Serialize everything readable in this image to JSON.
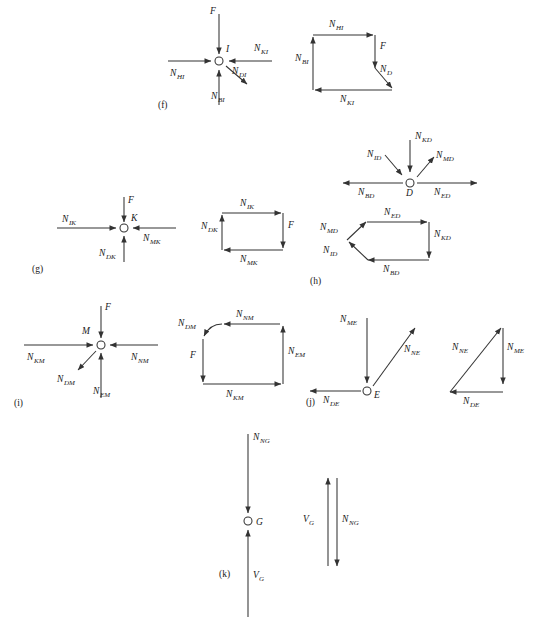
{
  "figure": {
    "kind": "force-polygon-diagram",
    "background_color": "#ffffff",
    "line_color": "#333333",
    "text_color": "#1a1a1a"
  },
  "panels": [
    {
      "id": "f",
      "label": "(f)",
      "joint": {
        "node_label": "I",
        "forces": [
          {
            "name": "F",
            "base": "F",
            "sub": "",
            "direction": "down"
          },
          {
            "name": "N_HI",
            "base": "N",
            "sub": "HI",
            "direction": "right"
          },
          {
            "name": "N_KI",
            "base": "N",
            "sub": "KI",
            "direction": "left"
          },
          {
            "name": "N_BI",
            "base": "N",
            "sub": "BI",
            "direction": "up"
          },
          {
            "name": "N_DI",
            "base": "N",
            "sub": "DI",
            "direction": "down-right"
          }
        ]
      },
      "polygon": {
        "edges": [
          {
            "name": "N_HI",
            "base": "N",
            "sub": "HI",
            "direction": "right"
          },
          {
            "name": "F",
            "base": "F",
            "sub": "",
            "direction": "down"
          },
          {
            "name": "N_D",
            "base": "N",
            "sub": "D",
            "direction": "down-right"
          },
          {
            "name": "N_KI",
            "base": "N",
            "sub": "KI",
            "direction": "left"
          },
          {
            "name": "N_BI",
            "base": "N",
            "sub": "BI",
            "direction": "up"
          }
        ]
      }
    },
    {
      "id": "g",
      "label": "(g)",
      "joint": {
        "node_label": "K",
        "forces": [
          {
            "name": "F",
            "base": "F",
            "sub": "",
            "direction": "down"
          },
          {
            "name": "N_IK",
            "base": "N",
            "sub": "IK",
            "direction": "right"
          },
          {
            "name": "N_MK",
            "base": "N",
            "sub": "MK",
            "direction": "left"
          },
          {
            "name": "N_DK",
            "base": "N",
            "sub": "DK",
            "direction": "up"
          }
        ]
      },
      "polygon": {
        "edges": [
          {
            "name": "N_IK",
            "base": "N",
            "sub": "IK",
            "direction": "right"
          },
          {
            "name": "F",
            "base": "F",
            "sub": "",
            "direction": "down"
          },
          {
            "name": "N_MK",
            "base": "N",
            "sub": "MK",
            "direction": "left"
          },
          {
            "name": "N_DK",
            "base": "N",
            "sub": "DK",
            "direction": "up"
          }
        ]
      }
    },
    {
      "id": "h",
      "label": "(h)",
      "joint": {
        "node_label": "D",
        "forces": [
          {
            "name": "N_KD",
            "base": "N",
            "sub": "KD",
            "direction": "down"
          },
          {
            "name": "N_ID",
            "base": "N",
            "sub": "ID",
            "direction": "down-left"
          },
          {
            "name": "N_MD",
            "base": "N",
            "sub": "MD",
            "direction": "up-right"
          },
          {
            "name": "N_BD",
            "base": "N",
            "sub": "BD",
            "direction": "left"
          },
          {
            "name": "N_ED",
            "base": "N",
            "sub": "ED",
            "direction": "right"
          }
        ]
      },
      "polygon": {
        "edges": [
          {
            "name": "N_ED",
            "base": "N",
            "sub": "ED",
            "direction": "right"
          },
          {
            "name": "N_KD",
            "base": "N",
            "sub": "KD",
            "direction": "down"
          },
          {
            "name": "N_BD",
            "base": "N",
            "sub": "BD",
            "direction": "left"
          },
          {
            "name": "N_ID",
            "base": "N",
            "sub": "ID",
            "direction": "up-left"
          },
          {
            "name": "N_MD",
            "base": "N",
            "sub": "MD",
            "direction": "up-right"
          }
        ]
      }
    },
    {
      "id": "i",
      "label": "(i)",
      "joint": {
        "node_label": "M",
        "forces": [
          {
            "name": "F",
            "base": "F",
            "sub": "",
            "direction": "down"
          },
          {
            "name": "N_KM",
            "base": "N",
            "sub": "KM",
            "direction": "right"
          },
          {
            "name": "N_NM",
            "base": "N",
            "sub": "NM",
            "direction": "left"
          },
          {
            "name": "N_EM",
            "base": "N",
            "sub": "EM",
            "direction": "up"
          },
          {
            "name": "N_DM",
            "base": "N",
            "sub": "DM",
            "direction": "down-left"
          }
        ]
      },
      "polygon": {
        "edges": [
          {
            "name": "N_NM",
            "base": "N",
            "sub": "NM",
            "direction": "left"
          },
          {
            "name": "N_DM",
            "base": "N",
            "sub": "DM",
            "direction": "down-left"
          },
          {
            "name": "F",
            "base": "F",
            "sub": "",
            "direction": "down"
          },
          {
            "name": "N_KM",
            "base": "N",
            "sub": "KM",
            "direction": "right"
          },
          {
            "name": "N_EM",
            "base": "N",
            "sub": "EM",
            "direction": "up"
          }
        ]
      }
    },
    {
      "id": "j",
      "label": "(j)",
      "joint": {
        "node_label": "E",
        "forces": [
          {
            "name": "N_ME",
            "base": "N",
            "sub": "ME",
            "direction": "down"
          },
          {
            "name": "N_NE",
            "base": "N",
            "sub": "NE",
            "direction": "up-right"
          },
          {
            "name": "N_DE",
            "base": "N",
            "sub": "DE",
            "direction": "left"
          }
        ]
      },
      "polygon": {
        "edges": [
          {
            "name": "N_NE",
            "base": "N",
            "sub": "NE",
            "direction": "up-right"
          },
          {
            "name": "N_ME",
            "base": "N",
            "sub": "ME",
            "direction": "down"
          },
          {
            "name": "N_DE",
            "base": "N",
            "sub": "DE",
            "direction": "left"
          }
        ]
      }
    },
    {
      "id": "k",
      "label": "(k)",
      "joint": {
        "node_label": "G",
        "forces": [
          {
            "name": "N_NG",
            "base": "N",
            "sub": "NG",
            "direction": "down"
          },
          {
            "name": "V_G",
            "base": "V",
            "sub": "G",
            "direction": "up"
          }
        ]
      },
      "polygon": {
        "edges": [
          {
            "name": "V_G",
            "base": "V",
            "sub": "G",
            "direction": "up"
          },
          {
            "name": "N_NG",
            "base": "N",
            "sub": "NG",
            "direction": "down"
          }
        ]
      }
    }
  ],
  "labels": {
    "f": "(f)",
    "g": "(g)",
    "h": "(h)",
    "i": "(i)",
    "j": "(j)",
    "k": "(k)",
    "node_I": "I",
    "node_K": "K",
    "node_D": "D",
    "node_M": "M",
    "node_E": "E",
    "node_G": "G",
    "F": "F",
    "N": "N",
    "V": "V",
    "HI": "HI",
    "KI": "KI",
    "BI": "BI",
    "DI": "DI",
    "D": "D",
    "IK": "IK",
    "MK": "MK",
    "DK": "DK",
    "KD": "KD",
    "ID": "ID",
    "MD": "MD",
    "BD": "BD",
    "ED": "ED",
    "KM": "KM",
    "NM": "NM",
    "EM": "EM",
    "DM": "DM",
    "ME": "ME",
    "NE": "NE",
    "DE": "DE",
    "NG": "NG",
    "G": "G"
  }
}
